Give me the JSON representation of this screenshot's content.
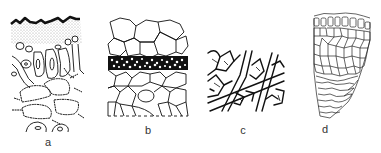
{
  "figure": {
    "type": "scientific-illustration",
    "panels": [
      {
        "id": "a",
        "label": "a",
        "content": "cross-section with dark wavy cortex top edge, stippled layer, elongated cells with nuclei and hairy-walled cells below"
      },
      {
        "id": "b",
        "label": "b",
        "content": "polygonal parenchyma cells with a dense dark band of small cells across the middle"
      },
      {
        "id": "c",
        "label": "c",
        "content": "interwoven network of branching hyphae/filaments"
      },
      {
        "id": "d",
        "label": "d",
        "content": "wedge-shaped section with rectangular cells on top, polygonal cells in middle, elongated wavy cells at bottom"
      }
    ],
    "colors": {
      "ink": "#111111",
      "stipple": "#9a9a9a",
      "background": "#ffffff",
      "label": "#333333"
    }
  }
}
